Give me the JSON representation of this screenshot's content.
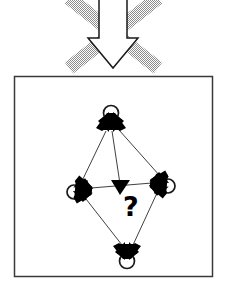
{
  "figure": {
    "background_color": "#ffffff",
    "ink_color": "#000000"
  },
  "top_symbol": {
    "name": "negated-downward-arrow",
    "arrow": {
      "label": "down-arrow",
      "direction": "down",
      "fill_color": "#ffffff",
      "stroke_color": "#1a1a1a",
      "stroke_width": 1.4,
      "shaft_left_x": 99,
      "shaft_right_x": 127,
      "shaft_top_y": -6,
      "head_top_y": 38,
      "head_left_x": 88,
      "head_right_x": 138,
      "tip_x": 113,
      "tip_y": 68
    },
    "cross": {
      "label": "cancel-cross",
      "color": "#b5b5b5",
      "pattern": "halftone-dither",
      "stroke_width": 13,
      "strokes": [
        {
          "x1": 69,
          "y1": 0,
          "x2": 158,
          "y2": 66
        },
        {
          "x1": 158,
          "y1": 0,
          "x2": 69,
          "y2": 66
        }
      ]
    }
  },
  "panel": {
    "name": "diagram-panel",
    "border_color": "#3a3a3a",
    "border_width": 1.5,
    "fill": "#ffffff",
    "x": 14,
    "y": 76,
    "width": 199,
    "height": 201
  },
  "graph": {
    "name": "directed-graph",
    "edge_color": "#2a2a2a",
    "edge_width": 0.9,
    "node_fill": "#000000",
    "loop_stroke": "#1a1a1a",
    "loop_width": 1.6,
    "nodes": [
      {
        "id": "top",
        "label": "node-top",
        "x": 111,
        "y": 122,
        "rotation": 0,
        "loop": {
          "cx": 111,
          "cy": 113,
          "rx": 7.5,
          "ry": 7.5
        }
      },
      {
        "id": "left",
        "label": "node-left",
        "x": 83,
        "y": 190,
        "rotation": 90,
        "loop": {
          "cx": 74,
          "cy": 192,
          "rx": 7.0,
          "ry": 7.0
        }
      },
      {
        "id": "right",
        "label": "node-right",
        "x": 159,
        "y": 184,
        "rotation": 270,
        "loop": {
          "cx": 168,
          "cy": 186,
          "rx": 7.0,
          "ry": 7.0
        }
      },
      {
        "id": "bottom",
        "label": "node-bottom",
        "x": 127,
        "y": 251,
        "rotation": 180,
        "loop": {
          "cx": 127,
          "cy": 261,
          "rx": 7.5,
          "ry": 7.5
        }
      }
    ],
    "edges": [
      {
        "from": "top",
        "to": "left",
        "label": "edge-top-left",
        "x1": 106,
        "y1": 131,
        "x2": 82,
        "y2": 181
      },
      {
        "from": "top",
        "to": "right",
        "label": "edge-top-right",
        "x1": 119,
        "y1": 130,
        "x2": 159,
        "y2": 176
      },
      {
        "from": "top",
        "to": "center",
        "label": "edge-top-center",
        "x1": 112,
        "y1": 131,
        "x2": 120,
        "y2": 183,
        "arrowhead": true
      },
      {
        "from": "left",
        "to": "right",
        "label": "edge-left-right",
        "x1": 92,
        "y1": 188,
        "x2": 152,
        "y2": 183
      },
      {
        "from": "left",
        "to": "bottom",
        "label": "edge-left-bottom",
        "x1": 86,
        "y1": 199,
        "x2": 122,
        "y2": 244
      },
      {
        "from": "right",
        "to": "bottom",
        "label": "edge-right-bottom",
        "x1": 157,
        "y1": 193,
        "x2": 133,
        "y2": 244
      }
    ],
    "center_arrowhead": {
      "label": "center-arrowhead",
      "x": 120,
      "y": 186,
      "direction": "down",
      "size": 10,
      "fill": "#000000"
    },
    "question_mark": {
      "label": "question-mark",
      "text": "?",
      "x": 133,
      "y": 210,
      "font_size": 26,
      "color": "#000000"
    }
  }
}
